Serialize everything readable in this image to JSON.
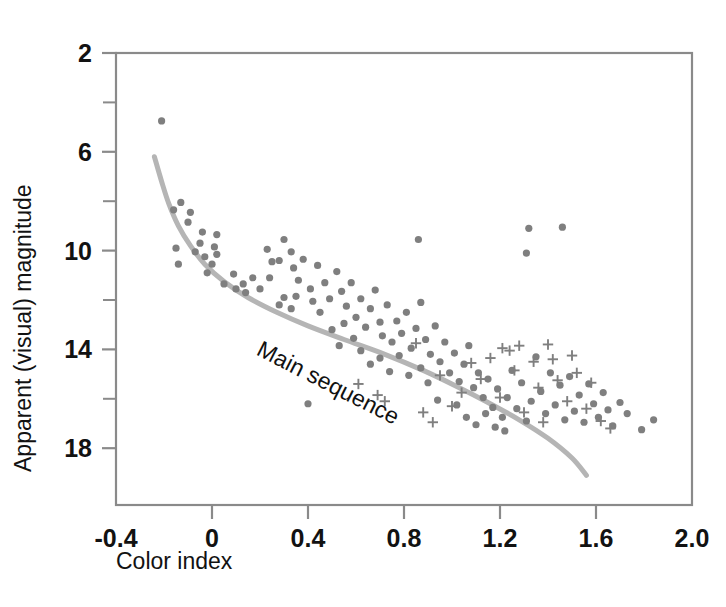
{
  "figure": {
    "background_color": "#ffffff",
    "frame_color": "#8a8a8a",
    "marker_color": "#7f7f7f",
    "curve_color": "#b5b5b5",
    "text_color": "#121212"
  },
  "chart_data": {
    "type": "scatter",
    "title": "",
    "subtitle": "",
    "xlabel": "Color index",
    "ylabel": "Apparent (visual) magnitude",
    "xlim": [
      -0.4,
      2.0
    ],
    "ylim": [
      2,
      20.3
    ],
    "y_inverted": true,
    "grid": false,
    "legend": null,
    "legend_position": "none",
    "x_ticks": [
      -0.4,
      0,
      0.4,
      0.8,
      1.2,
      1.6,
      2.0
    ],
    "x_tick_labels": [
      "-0.4",
      "0",
      "0.4",
      "0.8",
      "1.2",
      "1.6",
      "2.0"
    ],
    "x_minor_ticks": [],
    "y_ticks": [
      2,
      6,
      10,
      14,
      18
    ],
    "y_tick_labels": [
      "2",
      "6",
      "10",
      "14",
      "18"
    ],
    "y_minor_ticks": [
      4,
      8,
      12,
      16
    ],
    "annotations": [
      {
        "text": "Main sequence",
        "x": 0.18,
        "y": 14.2,
        "rotation_deg": 27
      }
    ],
    "series": [
      {
        "name": "stars-dot",
        "marker": "circle",
        "color": "#7f7f7f",
        "points": [
          [
            -0.21,
            4.75
          ],
          [
            -0.13,
            8.05
          ],
          [
            -0.16,
            8.35
          ],
          [
            -0.09,
            8.45
          ],
          [
            -0.1,
            8.85
          ],
          [
            -0.04,
            9.25
          ],
          [
            -0.05,
            9.7
          ],
          [
            -0.15,
            9.9
          ],
          [
            -0.07,
            10.05
          ],
          [
            -0.03,
            10.25
          ],
          [
            0.02,
            9.35
          ],
          [
            0.01,
            9.85
          ],
          [
            0.02,
            10.15
          ],
          [
            0.0,
            10.55
          ],
          [
            -0.14,
            10.55
          ],
          [
            -0.02,
            10.9
          ],
          [
            0.05,
            11.35
          ],
          [
            0.09,
            10.95
          ],
          [
            0.1,
            11.55
          ],
          [
            0.13,
            11.35
          ],
          [
            0.14,
            11.7
          ],
          [
            0.17,
            11.1
          ],
          [
            0.2,
            11.55
          ],
          [
            0.23,
            9.95
          ],
          [
            0.25,
            10.45
          ],
          [
            0.24,
            11.1
          ],
          [
            0.28,
            10.4
          ],
          [
            0.3,
            9.55
          ],
          [
            0.33,
            10.05
          ],
          [
            0.34,
            10.7
          ],
          [
            0.36,
            11.2
          ],
          [
            0.38,
            10.35
          ],
          [
            0.35,
            11.85
          ],
          [
            0.3,
            11.9
          ],
          [
            0.28,
            12.2
          ],
          [
            0.33,
            12.35
          ],
          [
            0.41,
            11.55
          ],
          [
            0.42,
            12.05
          ],
          [
            0.44,
            10.6
          ],
          [
            0.47,
            11.3
          ],
          [
            0.49,
            11.95
          ],
          [
            0.45,
            12.5
          ],
          [
            0.4,
            16.2
          ],
          [
            0.52,
            10.85
          ],
          [
            0.54,
            11.65
          ],
          [
            0.56,
            12.25
          ],
          [
            0.58,
            11.3
          ],
          [
            0.6,
            12.7
          ],
          [
            0.62,
            11.95
          ],
          [
            0.64,
            13.1
          ],
          [
            0.66,
            12.35
          ],
          [
            0.68,
            11.6
          ],
          [
            0.7,
            12.9
          ],
          [
            0.71,
            13.45
          ],
          [
            0.73,
            12.2
          ],
          [
            0.75,
            13.7
          ],
          [
            0.77,
            12.85
          ],
          [
            0.79,
            13.35
          ],
          [
            0.81,
            12.5
          ],
          [
            0.83,
            13.95
          ],
          [
            0.85,
            13.15
          ],
          [
            0.87,
            12.1
          ],
          [
            0.89,
            13.6
          ],
          [
            0.86,
            9.55
          ],
          [
            0.91,
            14.2
          ],
          [
            0.93,
            13.05
          ],
          [
            0.95,
            14.5
          ],
          [
            0.97,
            13.7
          ],
          [
            0.99,
            14.95
          ],
          [
            1.01,
            14.15
          ],
          [
            1.03,
            15.3
          ],
          [
            1.05,
            14.6
          ],
          [
            1.07,
            13.85
          ],
          [
            1.09,
            15.55
          ],
          [
            1.11,
            14.95
          ],
          [
            1.13,
            15.95
          ],
          [
            1.15,
            15.2
          ],
          [
            1.17,
            16.35
          ],
          [
            1.19,
            15.6
          ],
          [
            1.21,
            16.75
          ],
          [
            1.23,
            15.95
          ],
          [
            1.25,
            14.85
          ],
          [
            1.27,
            16.4
          ],
          [
            1.29,
            15.35
          ],
          [
            1.31,
            16.9
          ],
          [
            1.33,
            16.1
          ],
          [
            1.35,
            14.3
          ],
          [
            1.37,
            15.7
          ],
          [
            1.39,
            16.6
          ],
          [
            1.41,
            14.95
          ],
          [
            1.43,
            16.25
          ],
          [
            1.45,
            15.45
          ],
          [
            1.47,
            16.85
          ],
          [
            1.32,
            9.1
          ],
          [
            1.31,
            10.1
          ],
          [
            1.46,
            9.05
          ],
          [
            1.49,
            15.1
          ],
          [
            1.51,
            16.5
          ],
          [
            1.53,
            15.85
          ],
          [
            1.55,
            16.95
          ],
          [
            1.57,
            15.4
          ],
          [
            1.59,
            16.2
          ],
          [
            1.61,
            16.75
          ],
          [
            1.63,
            15.75
          ],
          [
            1.65,
            16.45
          ],
          [
            1.67,
            17.1
          ],
          [
            1.7,
            16.15
          ],
          [
            1.73,
            16.6
          ],
          [
            1.79,
            17.25
          ],
          [
            1.84,
            16.85
          ],
          [
            0.62,
            14.05
          ],
          [
            0.66,
            14.6
          ],
          [
            0.7,
            14.35
          ],
          [
            0.74,
            14.9
          ],
          [
            0.78,
            14.25
          ],
          [
            0.82,
            15.05
          ],
          [
            0.9,
            15.35
          ],
          [
            0.94,
            16.05
          ],
          [
            1.02,
            16.25
          ],
          [
            1.06,
            16.75
          ],
          [
            1.1,
            17.05
          ],
          [
            1.14,
            16.6
          ],
          [
            0.55,
            12.95
          ],
          [
            0.59,
            13.55
          ],
          [
            0.5,
            13.2
          ],
          [
            0.53,
            13.85
          ],
          [
            0.87,
            14.75
          ],
          [
            1.18,
            17.15
          ],
          [
            1.22,
            17.3
          ]
        ]
      },
      {
        "name": "stars-plus",
        "marker": "plus",
        "color": "#7f7f7f",
        "points": [
          [
            0.61,
            15.4
          ],
          [
            0.69,
            15.85
          ],
          [
            0.72,
            16.1
          ],
          [
            0.85,
            13.75
          ],
          [
            0.95,
            15.05
          ],
          [
            1.0,
            16.3
          ],
          [
            1.04,
            15.75
          ],
          [
            1.08,
            14.55
          ],
          [
            1.12,
            15.2
          ],
          [
            1.16,
            14.35
          ],
          [
            1.2,
            15.95
          ],
          [
            1.24,
            14.05
          ],
          [
            1.26,
            14.85
          ],
          [
            1.3,
            16.55
          ],
          [
            1.34,
            14.5
          ],
          [
            1.36,
            15.55
          ],
          [
            1.38,
            16.95
          ],
          [
            1.21,
            13.95
          ],
          [
            1.28,
            13.85
          ],
          [
            1.42,
            14.4
          ],
          [
            1.44,
            15.25
          ],
          [
            1.48,
            16.1
          ],
          [
            1.52,
            14.95
          ],
          [
            1.56,
            16.4
          ],
          [
            1.58,
            15.35
          ],
          [
            1.62,
            16.9
          ],
          [
            1.66,
            17.2
          ],
          [
            0.88,
            16.55
          ],
          [
            0.92,
            16.95
          ],
          [
            1.4,
            13.8
          ],
          [
            1.5,
            14.25
          ]
        ]
      }
    ],
    "main_sequence_curve": {
      "name": "Main sequence",
      "color": "#b5b5b5",
      "width": 5,
      "points": [
        [
          -0.24,
          6.2
        ],
        [
          -0.21,
          7.2
        ],
        [
          -0.18,
          8.1
        ],
        [
          -0.14,
          9.0
        ],
        [
          -0.09,
          9.8
        ],
        [
          -0.03,
          10.55
        ],
        [
          0.05,
          11.25
        ],
        [
          0.15,
          11.9
        ],
        [
          0.27,
          12.5
        ],
        [
          0.4,
          13.05
        ],
        [
          0.55,
          13.6
        ],
        [
          0.72,
          14.2
        ],
        [
          0.88,
          14.85
        ],
        [
          1.02,
          15.5
        ],
        [
          1.15,
          16.15
        ],
        [
          1.28,
          16.85
        ],
        [
          1.4,
          17.6
        ],
        [
          1.5,
          18.4
        ],
        [
          1.56,
          19.1
        ]
      ]
    }
  }
}
